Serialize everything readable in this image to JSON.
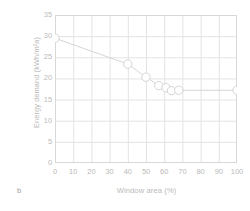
{
  "figure": {
    "panel_letter": "b",
    "background_color": "#ffffff",
    "axis_color": "#d8d8d8",
    "grid_color": "#e3e3e3",
    "text_color": "#b9b9b9",
    "series_color": "#d5d5d5",
    "marker_fill": "#ffffff"
  },
  "chart_data": {
    "type": "line",
    "title": "",
    "xlabel": "Window area (%)",
    "ylabel": "Energy demand (kWh/m²a)",
    "xlim": [
      0,
      100
    ],
    "ylim": [
      0,
      35
    ],
    "xticks": [
      0,
      10,
      20,
      30,
      40,
      50,
      60,
      70,
      80,
      90,
      100
    ],
    "yticks": [
      0,
      5,
      10,
      15,
      20,
      25,
      30,
      35
    ],
    "grid": true,
    "legend": "none",
    "marker": "open-circle",
    "series": [
      {
        "name": "Energy demand",
        "x": [
          0,
          40,
          50,
          57,
          61,
          64,
          68,
          100
        ],
        "y": [
          29.5,
          23.4,
          20.3,
          18.3,
          17.8,
          17.1,
          17.2,
          17.2
        ]
      }
    ]
  }
}
